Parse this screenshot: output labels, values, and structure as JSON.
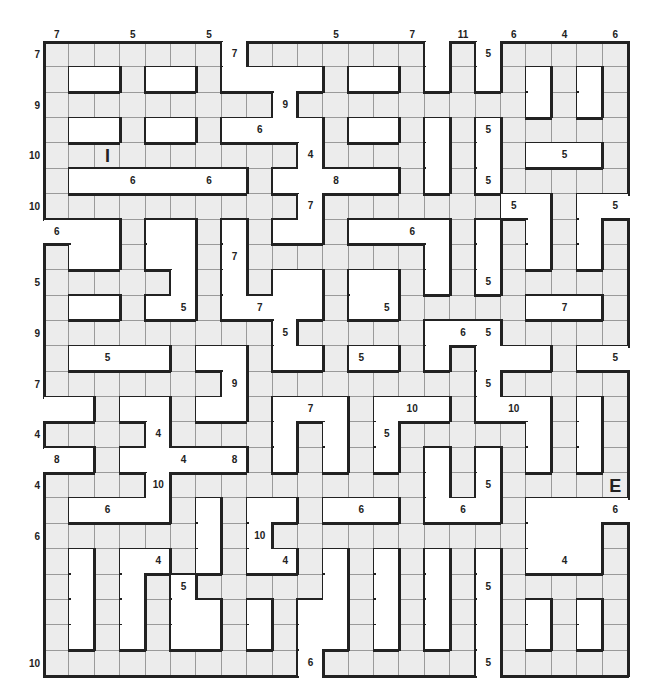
{
  "puzzle": {
    "title": "Number path grid puzzle",
    "cols": 23,
    "rows": 25,
    "colors": {
      "filled": "#ececec",
      "blank": "#ffffff",
      "border": "#222222",
      "gridline": "#9a9a9a"
    },
    "legend": "F = fillable square, . = blank",
    "grid": [
      "FFFFFFF.FFFFFFF.F.FFFFF",
      "F..F..F....F..F.F.F.F.F",
      "FFFFFFFFF.FFFFFFFFF.F.F",
      "F..F..F....F..F.F.FFFFF",
      "FFFFFFFFFF.FFFF.F.F...F",
      "F.......F.....F.F.FFFFF",
      "FFFFFFFFFF.FFFFFFF..F..",
      "...F..F.F..F....F.F.F.F",
      "F..F..F.FFFFFFF.F.F.F.F",
      "FFFFF.F.F..F..F.F.FFFFF",
      "F..F..F....F..FFFFF...F",
      "FFFFFFFFF.FFFFF...FFFFF",
      "F....F..F..F..F.F...F..",
      "FFFFFFF.FFFFFFFFF.FFFFF",
      "..F..F..F...F...F...F.F",
      "FFFF.FFFF.F.F.FFFFF.F.F",
      "..F.....F.F.F.F.F.F.F.F",
      "FFFF.FFFFFFFFFF.F.FFFFF",
      "F....F.F..F...F...F....",
      "FFFFFF.F.FFFFFFFFFF...F",
      "F.F..F.F..F.F.F.F.F...F",
      "F.F.F.FFFFF.F.F.F.FFFFF",
      "F.F.F..F.F..F.F.F.F.F.F",
      "F.F.F..F.F..F.F.F.F.F.F",
      "FFFFFFFFFF.FFFFFF.FFFFF"
    ],
    "top_labels": [
      {
        "col": 0,
        "text": "7"
      },
      {
        "col": 3,
        "text": "5"
      },
      {
        "col": 6,
        "text": "5"
      },
      {
        "col": 11,
        "text": "5"
      },
      {
        "col": 14,
        "text": "7"
      },
      {
        "col": 16,
        "text": "11"
      },
      {
        "col": 18,
        "text": "6"
      },
      {
        "col": 20,
        "text": "4"
      },
      {
        "col": 22,
        "text": "6"
      }
    ],
    "left_labels": [
      {
        "row": 0,
        "text": "7"
      },
      {
        "row": 2,
        "text": "9"
      },
      {
        "row": 4,
        "text": "10"
      },
      {
        "row": 6,
        "text": "10"
      },
      {
        "row": 9,
        "text": "5"
      },
      {
        "row": 11,
        "text": "9"
      },
      {
        "row": 13,
        "text": "7"
      },
      {
        "row": 15,
        "text": "4"
      },
      {
        "row": 17,
        "text": "4"
      },
      {
        "row": 19,
        "text": "6"
      },
      {
        "row": 24,
        "text": "10"
      }
    ],
    "cell_labels": [
      {
        "row": 0,
        "col": 7,
        "text": "7"
      },
      {
        "row": 0,
        "col": 17,
        "text": "5"
      },
      {
        "row": 2,
        "col": 9,
        "text": "9"
      },
      {
        "row": 3,
        "col": 8,
        "text": "6"
      },
      {
        "row": 3,
        "col": 17,
        "text": "5"
      },
      {
        "row": 4,
        "col": 2,
        "text": "I",
        "marker": true
      },
      {
        "row": 4,
        "col": 10,
        "text": "4"
      },
      {
        "row": 4,
        "col": 20,
        "text": "5"
      },
      {
        "row": 5,
        "col": 3,
        "text": "6"
      },
      {
        "row": 5,
        "col": 6,
        "text": "6"
      },
      {
        "row": 5,
        "col": 11,
        "text": "8"
      },
      {
        "row": 5,
        "col": 17,
        "text": "5"
      },
      {
        "row": 6,
        "col": 10,
        "text": "7"
      },
      {
        "row": 6,
        "col": 18,
        "text": "5"
      },
      {
        "row": 6,
        "col": 22,
        "text": "5"
      },
      {
        "row": 7,
        "col": 0,
        "text": "6"
      },
      {
        "row": 7,
        "col": 14,
        "text": "6"
      },
      {
        "row": 8,
        "col": 7,
        "text": "7"
      },
      {
        "row": 9,
        "col": 17,
        "text": "5"
      },
      {
        "row": 10,
        "col": 5,
        "text": "5"
      },
      {
        "row": 10,
        "col": 8,
        "text": "7"
      },
      {
        "row": 10,
        "col": 13,
        "text": "5"
      },
      {
        "row": 10,
        "col": 20,
        "text": "7"
      },
      {
        "row": 11,
        "col": 9,
        "text": "5"
      },
      {
        "row": 11,
        "col": 16,
        "text": "6"
      },
      {
        "row": 11,
        "col": 17,
        "text": "5"
      },
      {
        "row": 12,
        "col": 2,
        "text": "5"
      },
      {
        "row": 12,
        "col": 12,
        "text": "5"
      },
      {
        "row": 12,
        "col": 22,
        "text": "5"
      },
      {
        "row": 13,
        "col": 7,
        "text": "9"
      },
      {
        "row": 13,
        "col": 17,
        "text": "5"
      },
      {
        "row": 14,
        "col": 10,
        "text": "7"
      },
      {
        "row": 14,
        "col": 14,
        "text": "10"
      },
      {
        "row": 14,
        "col": 18,
        "text": "10"
      },
      {
        "row": 15,
        "col": 4,
        "text": "4"
      },
      {
        "row": 15,
        "col": 13,
        "text": "5"
      },
      {
        "row": 16,
        "col": 0,
        "text": "8"
      },
      {
        "row": 16,
        "col": 5,
        "text": "4"
      },
      {
        "row": 16,
        "col": 7,
        "text": "8"
      },
      {
        "row": 17,
        "col": 4,
        "text": "10"
      },
      {
        "row": 17,
        "col": 17,
        "text": "5"
      },
      {
        "row": 17,
        "col": 22,
        "text": "E",
        "marker": true
      },
      {
        "row": 18,
        "col": 2,
        "text": "6"
      },
      {
        "row": 18,
        "col": 12,
        "text": "6"
      },
      {
        "row": 18,
        "col": 16,
        "text": "6"
      },
      {
        "row": 18,
        "col": 22,
        "text": "6"
      },
      {
        "row": 19,
        "col": 8,
        "text": "10"
      },
      {
        "row": 20,
        "col": 4,
        "text": "4"
      },
      {
        "row": 20,
        "col": 9,
        "text": "4"
      },
      {
        "row": 20,
        "col": 20,
        "text": "4"
      },
      {
        "row": 21,
        "col": 5,
        "text": "5"
      },
      {
        "row": 21,
        "col": 17,
        "text": "5"
      },
      {
        "row": 24,
        "col": 10,
        "text": "6"
      },
      {
        "row": 24,
        "col": 17,
        "text": "5"
      }
    ]
  }
}
